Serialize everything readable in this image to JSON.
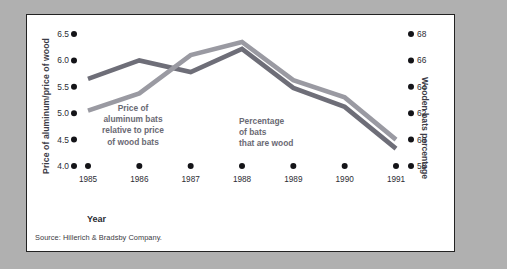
{
  "figure": {
    "source_note": "Source: Hillerich & Bradsby Company.",
    "background": "#ffffff",
    "page_background": "#b0b0b0",
    "border_color": "#222222"
  },
  "chart_data": {
    "type": "line",
    "title": "",
    "xlabel": "Year",
    "categories": [
      "1985",
      "1986",
      "1987",
      "1988",
      "1989",
      "1990",
      "1991"
    ],
    "grid": false,
    "legend": "inline-annotations",
    "axes": {
      "left": {
        "label": "Price of aluminum/price of wood",
        "ticks": [
          "4.0",
          "4.5",
          "5.0",
          "5.5",
          "6.0",
          "6.5"
        ],
        "tick_values": [
          4.0,
          4.5,
          5.0,
          5.5,
          6.0,
          6.5
        ],
        "ylim": [
          4.0,
          6.5
        ]
      },
      "right": {
        "label": "Wooden bats percentage",
        "ticks": [
          "58",
          "60",
          "62",
          "64",
          "66",
          "68"
        ],
        "tick_values": [
          58,
          60,
          62,
          64,
          66,
          68
        ],
        "ylim": [
          58,
          68
        ]
      }
    },
    "series": [
      {
        "name": "Price of aluminum bats relative to price of wood bats",
        "annotation_lines": [
          "Price of",
          "aluminum bats",
          "relative to price",
          "of wood bats"
        ],
        "axis": "left",
        "color": "#6e6e78",
        "values": [
          5.65,
          6.0,
          5.78,
          6.22,
          5.48,
          5.12,
          4.33
        ]
      },
      {
        "name": "Percentage of bats that are wood",
        "annotation_lines": [
          "Percentage",
          "of bats",
          "that are wood"
        ],
        "axis": "right",
        "color": "#9a9aa2",
        "values": [
          62.2,
          63.5,
          66.4,
          67.4,
          64.5,
          63.2,
          60.0
        ]
      }
    ]
  }
}
